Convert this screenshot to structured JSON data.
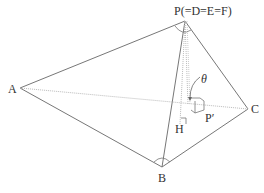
{
  "diagram": {
    "labels": {
      "P": "P(=D=E=F)",
      "A": "A",
      "B": "B",
      "C": "C",
      "H": "H",
      "Pp": "P′",
      "theta": "θ"
    },
    "colors": {
      "edge": "#777777",
      "hidden": "#b5b5b5",
      "text": "#333333"
    }
  }
}
